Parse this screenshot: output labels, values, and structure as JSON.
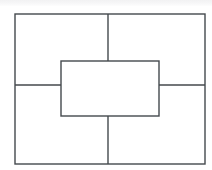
{
  "figure": {
    "canvas": {
      "width": 212,
      "height": 170
    },
    "background_color": "#ffffff",
    "top_band_color": "#f2f2f3",
    "stroke_color": "#44494d",
    "stroke_width": 1.4,
    "fill_color": "none"
  },
  "shapes": {
    "outer_rectangle": {
      "label": "outer-rectangle",
      "x": 15,
      "y": 14,
      "width": 190,
      "height": 150,
      "x2": 205,
      "y2": 164
    },
    "center_rectangle": {
      "label": "center-rectangle",
      "x": 61,
      "y": 61,
      "width": 98,
      "height": 55,
      "x2": 159,
      "y2": 116
    }
  },
  "dividers": [
    {
      "label": "top-vertical-divider",
      "orientation": "vertical",
      "x1": 108,
      "y1": 14,
      "x2": 108,
      "y2": 61
    },
    {
      "label": "bottom-vertical-divider",
      "orientation": "vertical",
      "x1": 108,
      "y1": 116,
      "x2": 108,
      "y2": 164
    },
    {
      "label": "left-horizontal-divider",
      "orientation": "horizontal",
      "x1": 15,
      "y1": 85,
      "x2": 61,
      "y2": 85
    },
    {
      "label": "right-horizontal-divider",
      "orientation": "horizontal",
      "x1": 159,
      "y1": 85,
      "x2": 205,
      "y2": 85
    }
  ],
  "regions": [
    {
      "label": "top-left-region"
    },
    {
      "label": "top-right-region"
    },
    {
      "label": "bottom-left-region"
    },
    {
      "label": "bottom-right-region"
    },
    {
      "label": "center-region"
    }
  ]
}
